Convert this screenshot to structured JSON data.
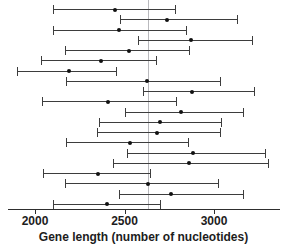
{
  "chart_data": {
    "type": "scatter",
    "title": "",
    "xlabel": "Gene length (number of nucleotides)",
    "ylabel": "",
    "xlim": [
      1870,
      3370
    ],
    "grid": false,
    "legend": null,
    "reference_line": 2630,
    "xticks": [
      2000,
      2500,
      3000
    ],
    "xticklabels": [
      "2000",
      "2500",
      "3000"
    ],
    "note": "Forest-style plot: each row is one study/estimate with a point estimate and a horizontal confidence interval. Values read off the x-axis in nucleotides.",
    "series": [
      {
        "name": "estimate-1",
        "point": 2445,
        "low": 2102,
        "high": 2790
      },
      {
        "name": "estimate-2",
        "point": 2740,
        "low": 2477,
        "high": 3135
      },
      {
        "name": "estimate-3",
        "point": 2468,
        "low": 2102,
        "high": 2849
      },
      {
        "name": "estimate-4",
        "point": 2870,
        "low": 2574,
        "high": 3220
      },
      {
        "name": "estimate-5",
        "point": 2525,
        "low": 2167,
        "high": 2865
      },
      {
        "name": "estimate-6",
        "point": 2370,
        "low": 2033,
        "high": 2682
      },
      {
        "name": "estimate-7",
        "point": 2188,
        "low": 1898,
        "high": 2456
      },
      {
        "name": "estimate-8",
        "point": 2628,
        "low": 2172,
        "high": 3038
      },
      {
        "name": "estimate-9",
        "point": 2876,
        "low": 2602,
        "high": 3231
      },
      {
        "name": "estimate-10",
        "point": 2408,
        "low": 2038,
        "high": 2795
      },
      {
        "name": "estimate-11",
        "point": 2818,
        "low": 2500,
        "high": 3167
      },
      {
        "name": "estimate-12",
        "point": 2700,
        "low": 2360,
        "high": 3045
      },
      {
        "name": "estimate-13",
        "point": 2682,
        "low": 2344,
        "high": 3040
      },
      {
        "name": "estimate-14",
        "point": 2528,
        "low": 2172,
        "high": 2860
      },
      {
        "name": "estimate-15",
        "point": 2882,
        "low": 2516,
        "high": 3290
      },
      {
        "name": "estimate-16",
        "point": 2860,
        "low": 2435,
        "high": 3310
      },
      {
        "name": "estimate-17",
        "point": 2350,
        "low": 2043,
        "high": 2650
      },
      {
        "name": "estimate-18",
        "point": 2630,
        "low": 2167,
        "high": 3030
      },
      {
        "name": "estimate-19",
        "point": 2762,
        "low": 2472,
        "high": 3170
      },
      {
        "name": "estimate-20",
        "point": 2405,
        "low": 2100,
        "high": 2705
      }
    ]
  },
  "axis": {
    "x_label": "Gene length (number of nucleotides)",
    "tick_2000": "2000",
    "tick_2500": "2500",
    "tick_3000": "3000"
  },
  "colors": {
    "point": "#111111",
    "whisker": "#3d3d3d",
    "axis": "#2e2e2e",
    "reference_line": "#b9b9bd",
    "background": "#ffffff",
    "text": "#1d1d1d"
  }
}
